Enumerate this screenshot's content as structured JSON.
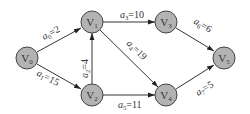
{
  "diagram": {
    "type": "directed-weighted-graph",
    "colors": {
      "node_fill": "#b3b3b3",
      "node_stroke": "#444444",
      "edge": "#333333",
      "text": "#333333"
    },
    "nodes": [
      {
        "id": "V0",
        "base": "V",
        "sub": "0",
        "x": 27,
        "y": 58
      },
      {
        "id": "V1",
        "base": "V",
        "sub": "1",
        "x": 92,
        "y": 22
      },
      {
        "id": "V2",
        "base": "V",
        "sub": "2",
        "x": 92,
        "y": 95
      },
      {
        "id": "V3",
        "base": "V",
        "sub": "3",
        "x": 166,
        "y": 22
      },
      {
        "id": "V4",
        "base": "V",
        "sub": "4",
        "x": 166,
        "y": 95
      },
      {
        "id": "V5",
        "base": "V",
        "sub": "5",
        "x": 224,
        "y": 58
      }
    ],
    "edges": [
      {
        "id": "a0",
        "from": "V0",
        "to": "V1",
        "name": "a",
        "sub": "0",
        "weight": "=2"
      },
      {
        "id": "a1",
        "from": "V0",
        "to": "V2",
        "name": "a",
        "sub": "1",
        "weight": "=15"
      },
      {
        "id": "a2",
        "from": "V2",
        "to": "V1",
        "name": "a",
        "sub": "2",
        "weight": "=4"
      },
      {
        "id": "a3",
        "from": "V1",
        "to": "V3",
        "name": "a",
        "sub": "3",
        "weight": "=10"
      },
      {
        "id": "a4",
        "from": "V1",
        "to": "V4",
        "name": "a",
        "sub": "4",
        "weight": "=19"
      },
      {
        "id": "a5",
        "from": "V2",
        "to": "V4",
        "name": "a",
        "sub": "5",
        "weight": "=11"
      },
      {
        "id": "a6",
        "from": "V3",
        "to": "V5",
        "name": "a",
        "sub": "6",
        "weight": "=6"
      },
      {
        "id": "a7",
        "from": "V4",
        "to": "V5",
        "name": "a",
        "sub": "7",
        "weight": "=5"
      }
    ]
  }
}
